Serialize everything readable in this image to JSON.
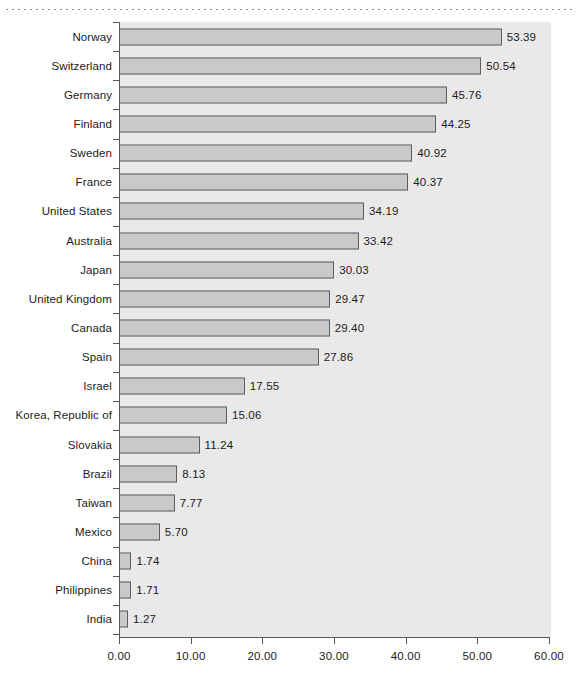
{
  "figure": {
    "decor": {
      "top_rule": "dotted-rule"
    },
    "caption_partial": ""
  },
  "chart_data": {
    "type": "bar",
    "orientation": "horizontal",
    "title": "",
    "subtitle": "",
    "xlabel": "",
    "ylabel": "",
    "xlim": [
      0,
      60
    ],
    "ylim": null,
    "grid": false,
    "legend": null,
    "legend_position": "none",
    "value_label_format": "0.00",
    "xtick_labels": [
      "0.00",
      "10.00",
      "20.00",
      "30.00",
      "40.00",
      "50.00",
      "60.00"
    ],
    "xticks": [
      0,
      10,
      20,
      30,
      40,
      50,
      60
    ],
    "categories": [
      "Norway",
      "Switzerland",
      "Germany",
      "Finland",
      "Sweden",
      "France",
      "United States",
      "Australia",
      "Japan",
      "United Kingdom",
      "Canada",
      "Spain",
      "Israel",
      "Korea, Republic of",
      "Slovakia",
      "Brazil",
      "Taiwan",
      "Mexico",
      "China",
      "Philippines",
      "India"
    ],
    "values": [
      53.39,
      50.54,
      45.76,
      44.25,
      40.92,
      40.37,
      34.19,
      33.42,
      30.03,
      29.47,
      29.4,
      27.86,
      17.55,
      15.06,
      11.24,
      8.13,
      7.77,
      5.7,
      1.74,
      1.71,
      1.27
    ],
    "value_labels": [
      "53.39",
      "50.54",
      "45.76",
      "44.25",
      "40.92",
      "40.37",
      "34.19",
      "33.42",
      "30.03",
      "29.47",
      "29.40",
      "27.86",
      "17.55",
      "15.06",
      "11.24",
      "8.13",
      "7.77",
      "5.70",
      "1.74",
      "1.71",
      "1.27"
    ],
    "colors": {
      "bar_fill": "#c9c9c9",
      "bar_edge": "#5e5e5e",
      "plot_background": "#e9e9e9",
      "page_background": "#ffffff",
      "axis": "#595959",
      "text": "#1b1b1b",
      "rule": "#8d8d8d"
    }
  }
}
